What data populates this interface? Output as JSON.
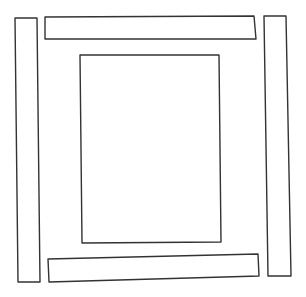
{
  "diagram": {
    "stroke_color": "#333333",
    "fill_color": "#ffffff",
    "shapes": [
      {
        "name": "left-bar",
        "points": "15,18 37,18 40,282 18,282"
      },
      {
        "name": "top-bar",
        "points": "45,17 254,16 256,39 45,39"
      },
      {
        "name": "center-rect",
        "points": "80,55 219,55 221,242 82,243"
      },
      {
        "name": "right-bar",
        "points": "264,16 286,16 291,276 268,276"
      },
      {
        "name": "bottom-bar",
        "points": "48,259 258,254 259,276 49,282"
      }
    ]
  }
}
